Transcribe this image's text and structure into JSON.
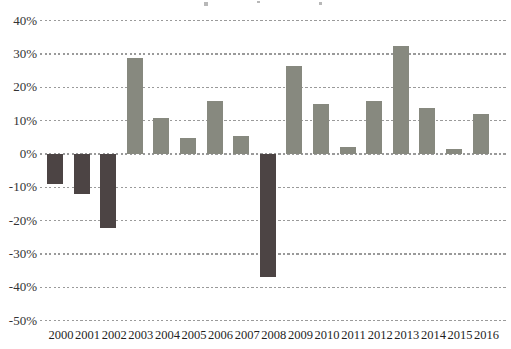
{
  "chart_data": {
    "type": "bar",
    "categories": [
      "2000",
      "2001",
      "2002",
      "2003",
      "2004",
      "2005",
      "2006",
      "2007",
      "2008",
      "2009",
      "2010",
      "2011",
      "2012",
      "2013",
      "2014",
      "2015",
      "2016"
    ],
    "values": [
      -9.1,
      -11.9,
      -22.1,
      28.7,
      10.9,
      4.9,
      15.8,
      5.5,
      -37.0,
      26.5,
      15.1,
      2.1,
      16.0,
      32.4,
      13.7,
      1.4,
      12.0
    ],
    "value_unit": "%",
    "title": "",
    "xlabel": "",
    "ylabel": "",
    "ylim": [
      -50,
      40
    ],
    "y_ticks": [
      40,
      30,
      20,
      10,
      0,
      -10,
      -20,
      -30,
      -40,
      -50
    ],
    "y_tick_labels": [
      "40%",
      "30%",
      "20%",
      "10%",
      "0%",
      "-10%",
      "-20%",
      "-30%",
      "-40%",
      "-50%"
    ],
    "grid": "dotted-horizontal",
    "legend": "none",
    "positive_color": "#87897F",
    "negative_color": "#4C4444",
    "gridline_color": "#9a9a9a",
    "y_label_color": "#333333",
    "x_label_color": "#1f1f1f"
  }
}
